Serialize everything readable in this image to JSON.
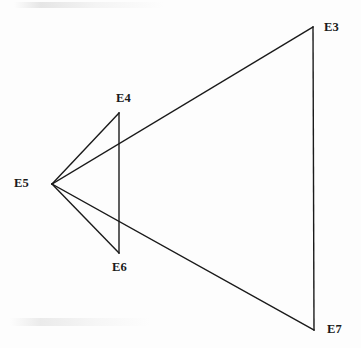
{
  "figure": {
    "type": "line-diagram",
    "title": "",
    "canvas": {
      "width": 361,
      "height": 348
    },
    "background_color": "#fdfdfd",
    "line_color": "#1a1a1a",
    "label_color": "#1a1a1a",
    "stroke_width": 1.4,
    "vertices": [
      {
        "id": "E3",
        "label": "E3",
        "x": 313,
        "y": 27,
        "label_x": 324,
        "label_y": 21,
        "label_anchor": "right-of-vertex"
      },
      {
        "id": "E4",
        "label": "E4",
        "x": 119,
        "y": 113,
        "label_x": 116,
        "label_y": 92,
        "label_anchor": "above-vertex"
      },
      {
        "id": "E5",
        "label": "E5",
        "x": 52,
        "y": 184,
        "label_x": 14,
        "label_y": 177,
        "label_anchor": "left-of-vertex"
      },
      {
        "id": "E6",
        "label": "E6",
        "x": 119,
        "y": 253,
        "label_x": 112,
        "label_y": 261,
        "label_anchor": "below-vertex"
      },
      {
        "id": "E7",
        "label": "E7",
        "x": 314,
        "y": 330,
        "label_x": 327,
        "label_y": 323,
        "label_anchor": "right-of-vertex"
      }
    ],
    "edges": [
      {
        "id": "edge-e5-e4",
        "from": "E5",
        "to": "E4",
        "x1": 52,
        "y1": 184,
        "x2": 119,
        "y2": 113
      },
      {
        "id": "edge-e5-e3",
        "from": "E5",
        "to": "E3",
        "x1": 52,
        "y1": 184,
        "x2": 313,
        "y2": 27
      },
      {
        "id": "edge-e5-e6",
        "from": "E5",
        "to": "E6",
        "x1": 52,
        "y1": 184,
        "x2": 119,
        "y2": 253
      },
      {
        "id": "edge-e5-e7",
        "from": "E5",
        "to": "E7",
        "x1": 52,
        "y1": 184,
        "x2": 314,
        "y2": 330
      },
      {
        "id": "edge-e4-e6",
        "from": "E4",
        "to": "E6",
        "x1": 119,
        "y1": 113,
        "x2": 119,
        "y2": 253
      },
      {
        "id": "edge-e3-e7",
        "from": "E3",
        "to": "E7",
        "x1": 313,
        "y1": 27,
        "x2": 314,
        "y2": 330
      }
    ]
  }
}
